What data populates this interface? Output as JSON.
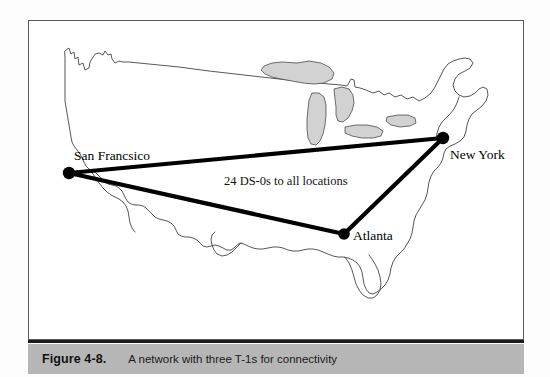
{
  "figure": {
    "caption_number": "Figure 4-8.",
    "caption_text": "A network with three T-1s for connectivity",
    "frame_border_color": "#5a5a5a",
    "caption_bar_color": "#b6b6b6",
    "line_color": "#000000",
    "lake_fill_color": "#d2d2d2",
    "coast_color": "#3a3a3a"
  },
  "map": {
    "title": "United States outline map",
    "background_color": "#ffffff"
  },
  "network": {
    "annotation": "24 DS-0s to all locations",
    "nodes": [
      {
        "id": "san-francisco",
        "label": "San Francsico",
        "x": 40,
        "y": 152,
        "label_x": 45,
        "label_y": 139,
        "label_anchor": "start"
      },
      {
        "id": "new-york",
        "label": "New York",
        "x": 414,
        "y": 117,
        "label_x": 421,
        "label_y": 138,
        "label_anchor": "start"
      },
      {
        "id": "atlanta",
        "label": "Atlanta",
        "x": 315,
        "y": 213,
        "label_x": 324,
        "label_y": 219,
        "label_anchor": "start"
      }
    ],
    "links": [
      {
        "id": "sf-ny",
        "from": "san-francisco",
        "to": "new-york"
      },
      {
        "id": "sf-atlanta",
        "from": "san-francisco",
        "to": "atlanta"
      },
      {
        "id": "atlanta-ny",
        "from": "atlanta",
        "to": "new-york"
      }
    ],
    "annotation_x": 195,
    "annotation_y": 164
  }
}
